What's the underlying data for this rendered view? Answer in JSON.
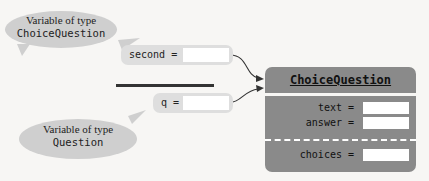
{
  "callouts": [
    {
      "line1": "Variable of type",
      "line2": "ChoiceQuestion"
    },
    {
      "line1": "Variable of type",
      "line2": "Question"
    }
  ],
  "variables": [
    {
      "label": "second ="
    },
    {
      "label": "q ="
    }
  ],
  "object": {
    "class_name": "ChoiceQuestion",
    "fields": [
      {
        "label": "text ="
      },
      {
        "label": "answer ="
      },
      {
        "label": "choices ="
      }
    ]
  },
  "colors": {
    "object_fill": "#8a8a8a",
    "callout_fill": "#cfcfcf",
    "variable_fill": "#dedede"
  }
}
